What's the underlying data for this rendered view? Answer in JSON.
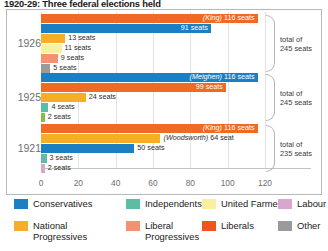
{
  "title": "1920-29: Three federal elections held",
  "chart_data": {
    "type": "bar",
    "title": "1920-29: Three federal elections held",
    "orientation": "horizontal",
    "xlabel": "",
    "ylabel": "",
    "xlim": [
      0,
      130
    ],
    "xticks": [
      0,
      20,
      40,
      60,
      80,
      100,
      120
    ],
    "grid": true,
    "legend_position": "bottom",
    "categories": [
      "1926",
      "1925",
      "1921"
    ],
    "groups": [
      {
        "year": "1926",
        "total_label": "total of\n245 seats",
        "total": 245,
        "bars": [
          {
            "party": "Liberals",
            "value": 116,
            "label": "116 seats",
            "leader": "(King)",
            "color": "#ef6a22",
            "label_inside": true
          },
          {
            "party": "Conservatives",
            "value": 91,
            "label": "91 seats",
            "leader": "",
            "color": "#1c7fc4",
            "label_inside": true
          },
          {
            "party": "National Progressives",
            "value": 13,
            "label": "13 seats",
            "leader": "",
            "color": "#f7ae26",
            "label_inside": false
          },
          {
            "party": "United Farmers",
            "value": 11,
            "label": "11 seats",
            "leader": "",
            "color": "#faeea0",
            "label_inside": false
          },
          {
            "party": "Liberal Progressives",
            "value": 9,
            "label": "9 seats",
            "leader": "",
            "color": "#f59070",
            "label_inside": false
          },
          {
            "party": "Other",
            "value": 5,
            "label": "5 seats",
            "leader": "",
            "color": "#9a9a9a",
            "label_inside": false
          }
        ]
      },
      {
        "year": "1925",
        "total_label": "total of\n245 seats",
        "total": 245,
        "bars": [
          {
            "party": "Conservatives",
            "value": 116,
            "label": "116 seats",
            "leader": "(Meighen)",
            "color": "#1c7fc4",
            "label_inside": true
          },
          {
            "party": "Liberals",
            "value": 99,
            "label": "99 seats",
            "leader": "",
            "color": "#ef6a22",
            "label_inside": true
          },
          {
            "party": "National Progressives",
            "value": 24,
            "label": "24 seats",
            "leader": "",
            "color": "#f7ae26",
            "label_inside": false
          },
          {
            "party": "Independents",
            "value": 4,
            "label": "4 seats",
            "leader": "",
            "color": "#5bbda6",
            "label_inside": false
          },
          {
            "party": "Other",
            "value": 2,
            "label": "2 seats",
            "leader": "",
            "color": "#7fc241",
            "label_inside": false
          }
        ]
      },
      {
        "year": "1921",
        "total_label": "total of\n235 seats",
        "total": 235,
        "bars": [
          {
            "party": "Liberals",
            "value": 116,
            "label": "116 seats",
            "leader": "(King)",
            "color": "#ef6a22",
            "label_inside": true
          },
          {
            "party": "National Progressives",
            "value": 64,
            "label": "64 seat",
            "leader": "(Woodsworth)",
            "color": "#f7ae26",
            "label_inside": false
          },
          {
            "party": "Conservatives",
            "value": 50,
            "label": "50 seats",
            "leader": "",
            "color": "#1c7fc4",
            "label_inside": false
          },
          {
            "party": "Independents",
            "value": 3,
            "label": "3 seats",
            "leader": "",
            "color": "#5bbda6",
            "label_inside": false
          },
          {
            "party": "Labour",
            "value": 2,
            "label": "2 seats",
            "leader": "",
            "color": "#d9a7cd",
            "label_inside": false
          }
        ]
      }
    ]
  },
  "legend": {
    "items": [
      {
        "label": "Conservatives",
        "color": "#1c7fc4"
      },
      {
        "label": "National\nProgressives",
        "color": "#f7ae26"
      },
      {
        "label": "Independents",
        "color": "#5bbda6"
      },
      {
        "label": "Liberal\nProgressives",
        "color": "#f59070"
      },
      {
        "label": "United Farmers",
        "color": "#faeea0"
      },
      {
        "label": "Liberals",
        "color": "#f4511e"
      },
      {
        "label": "Labour",
        "color": "#d9a7cd"
      },
      {
        "label": "Other",
        "color": "#9a9a9a"
      }
    ]
  }
}
